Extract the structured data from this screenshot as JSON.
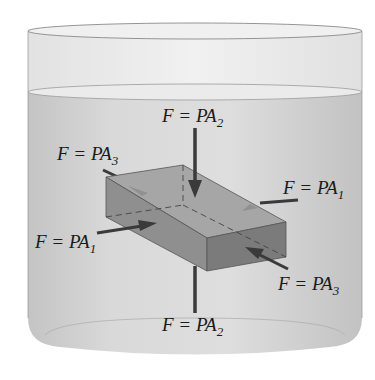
{
  "figure": {
    "colors": {
      "background": "#ffffff",
      "container_glass": "#ececec",
      "fluid": "#d4d4d4",
      "block_top": "#a9a9a9",
      "block_side": "#8c8c8c",
      "block_front": "#7d7d7d",
      "arrow": "#3a3a3a",
      "outline": "#555555"
    }
  },
  "labels": {
    "top_force": {
      "var": "F = PA",
      "sub": "2"
    },
    "bottom_force": {
      "var": "F = PA",
      "sub": "2"
    },
    "left_force": {
      "var": "F = PA",
      "sub": "1"
    },
    "right_force": {
      "var": "F = PA",
      "sub": "1"
    },
    "back_force": {
      "var": "F = PA",
      "sub": "3"
    },
    "front_force": {
      "var": "F = PA",
      "sub": "3"
    }
  }
}
